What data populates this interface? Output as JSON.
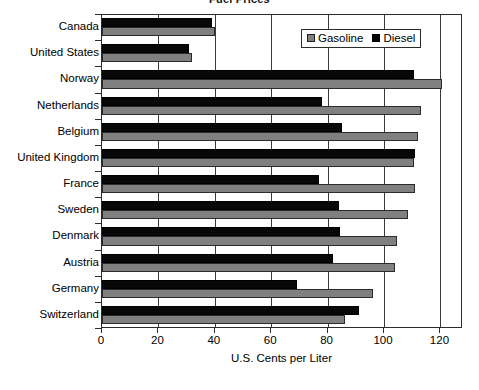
{
  "chart_data": {
    "type": "bar",
    "orientation": "horizontal",
    "title": "Fuel Prices",
    "xlabel": "U.S. Cents per Liter",
    "ylabel": "",
    "xlim": [
      0,
      128
    ],
    "xticks": [
      0,
      20,
      40,
      60,
      80,
      100,
      120
    ],
    "xtick_labels": [
      "0",
      "20",
      "40",
      "60",
      "80",
      "100",
      "120"
    ],
    "grid": true,
    "grid_axis": "x",
    "legend_position": "upper right",
    "categories": [
      "Canada",
      "United States",
      "Norway",
      "Netherlands",
      "Belgium",
      "United Kingdom",
      "France",
      "Sweden",
      "Denmark",
      "Austria",
      "Germany",
      "Switzerland"
    ],
    "series": [
      {
        "name": "Gasoline",
        "color": "#808080",
        "values": [
          40,
          32,
          120.5,
          113,
          112,
          110.5,
          111,
          108.5,
          104.5,
          104,
          96,
          86
        ]
      },
      {
        "name": "Diesel",
        "color": "#080808",
        "values": [
          39,
          31,
          110.5,
          78,
          85,
          111,
          77,
          84,
          84.5,
          82,
          69,
          91
        ]
      }
    ]
  },
  "legend": {
    "entries": [
      {
        "label": "Gasoline",
        "swatch": "gasoline-swatch-icon"
      },
      {
        "label": "Diesel",
        "swatch": "diesel-swatch-icon"
      }
    ]
  }
}
